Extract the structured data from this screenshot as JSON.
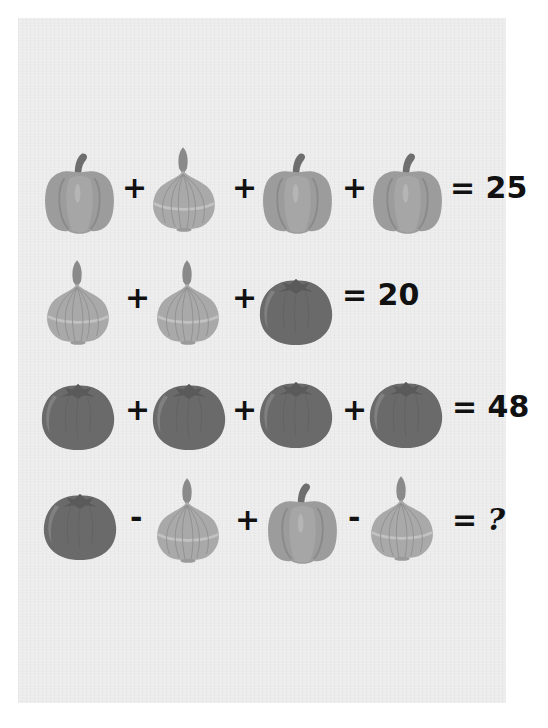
{
  "puzzle": {
    "rows": [
      {
        "items": [
          "pepper",
          "onion",
          "pepper",
          "pepper"
        ],
        "operators": [
          "+",
          "+",
          "+"
        ],
        "result": "= 25"
      },
      {
        "items": [
          "onion",
          "onion",
          "tomato"
        ],
        "operators": [
          "+",
          "+"
        ],
        "result": "= 20"
      },
      {
        "items": [
          "tomato",
          "tomato",
          "tomato",
          "tomato"
        ],
        "operators": [
          "+",
          "+",
          "+"
        ],
        "result": "= 48"
      },
      {
        "items": [
          "tomato",
          "onion",
          "pepper",
          "onion"
        ],
        "operators": [
          "-",
          "+",
          "-"
        ],
        "result_eq": "=",
        "result_q": "?"
      }
    ]
  },
  "icons": {
    "pepper": "bell-pepper-icon",
    "onion": "onion-icon",
    "tomato": "tomato-icon"
  },
  "colors": {
    "background": "#ececec",
    "pepper": "#9a9a9a",
    "onion": "#a8a8a8",
    "tomato": "#6a6a6a",
    "text": "#111111"
  }
}
